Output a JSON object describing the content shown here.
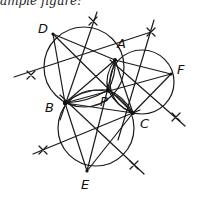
{
  "caption": "ample figure:",
  "points": {
    "A": {
      "label": "A",
      "x": 115,
      "y": 60
    },
    "B": {
      "label": "B",
      "x": 65,
      "y": 103
    },
    "C": {
      "label": "C",
      "x": 133,
      "y": 113
    },
    "D": {
      "label": "D",
      "x": 53,
      "y": 34
    },
    "E": {
      "label": "E",
      "x": 87,
      "y": 171
    },
    "F": {
      "label": "F",
      "x": 171,
      "y": 74
    },
    "P": {
      "label": "P",
      "x": 108,
      "y": 90
    }
  },
  "labels": {
    "A": "A",
    "B": "B",
    "C": "C",
    "D": "D",
    "E": "E",
    "F": "F",
    "P": "P"
  },
  "colors": {
    "stroke": "#1a1a1a",
    "background": "#ffffff"
  }
}
